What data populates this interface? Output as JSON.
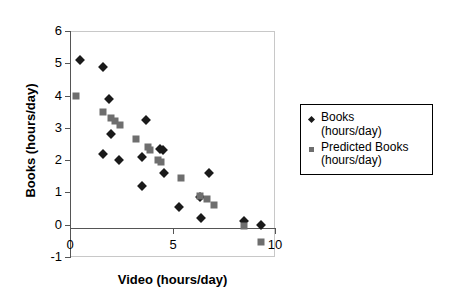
{
  "chart_data": {
    "type": "scatter",
    "title": "",
    "xlabel": "Video (hours/day)",
    "ylabel": "Books (hours/day)",
    "xlim": [
      0,
      10
    ],
    "ylim": [
      -1,
      6
    ],
    "xticks": [
      "0",
      "5",
      "10"
    ],
    "xtick_values": [
      0,
      5,
      10
    ],
    "yticks": [
      "6",
      "5",
      "4",
      "3",
      "2",
      "1",
      "0",
      "-1"
    ],
    "ytick_values": [
      6,
      5,
      4,
      3,
      2,
      1,
      0,
      -1
    ],
    "grid": false,
    "legend_position": "right",
    "series": [
      {
        "name": "Books (hours/day)",
        "marker": "diamond",
        "color": "#1a1a1a",
        "points": [
          [
            0.5,
            5.1
          ],
          [
            1.6,
            4.9
          ],
          [
            1.9,
            3.9
          ],
          [
            2.0,
            2.8
          ],
          [
            1.6,
            2.2
          ],
          [
            2.4,
            2.0
          ],
          [
            3.7,
            3.25
          ],
          [
            3.5,
            2.1
          ],
          [
            3.5,
            1.2
          ],
          [
            4.4,
            2.35
          ],
          [
            4.55,
            2.3
          ],
          [
            4.6,
            1.6
          ],
          [
            5.3,
            0.55
          ],
          [
            6.35,
            0.85
          ],
          [
            6.4,
            0.2
          ],
          [
            6.8,
            1.6
          ],
          [
            8.5,
            0.1
          ],
          [
            9.3,
            0.0
          ]
        ]
      },
      {
        "name": "Predicted Books (hours/day)",
        "marker": "square",
        "color": "#6e6e6e",
        "points": [
          [
            0.3,
            4.0
          ],
          [
            1.6,
            3.5
          ],
          [
            2.0,
            3.3
          ],
          [
            2.2,
            3.2
          ],
          [
            2.45,
            3.1
          ],
          [
            3.2,
            2.65
          ],
          [
            3.8,
            2.4
          ],
          [
            3.9,
            2.3
          ],
          [
            4.3,
            2.0
          ],
          [
            4.45,
            1.95
          ],
          [
            5.4,
            1.45
          ],
          [
            6.35,
            0.9
          ],
          [
            6.7,
            0.8
          ],
          [
            7.0,
            0.6
          ],
          [
            8.5,
            -0.05
          ],
          [
            9.3,
            -0.55
          ]
        ]
      }
    ]
  },
  "legend": {
    "entries": [
      {
        "label_line1": "Books",
        "label_line2": "(hours/day)",
        "marker": "diamond-marker-icon"
      },
      {
        "label_line1": "Predicted Books",
        "label_line2": "(hours/day)",
        "marker": "square-marker-icon"
      }
    ]
  }
}
